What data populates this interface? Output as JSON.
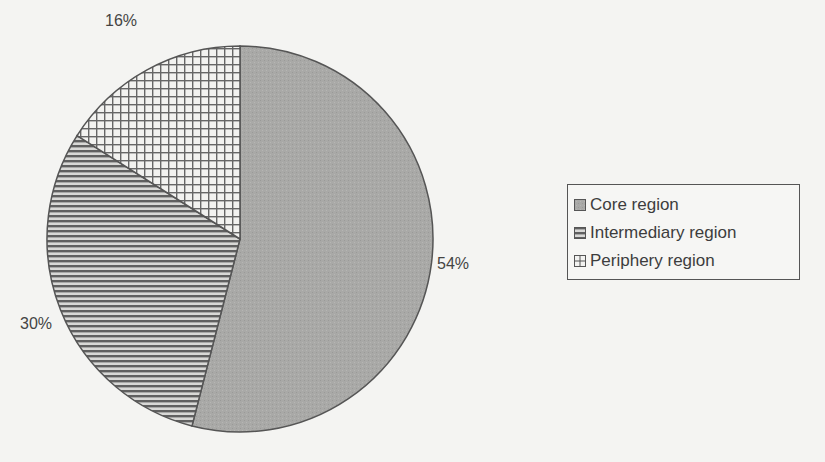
{
  "chart_data": {
    "type": "pie",
    "title": "",
    "categories": [
      "Core region",
      "Intermediary region",
      "Periphery region"
    ],
    "values": [
      54,
      30,
      16
    ],
    "labels": [
      "54%",
      "30%",
      "16%"
    ],
    "legend_position": "right",
    "patterns": [
      "stipple-gray",
      "horizontal-lines",
      "grid"
    ],
    "start_angle_deg": 0,
    "direction": "clockwise"
  },
  "legend": {
    "items": [
      {
        "label": "Core region",
        "pattern": "stipple"
      },
      {
        "label": "Intermediary region",
        "pattern": "hlines"
      },
      {
        "label": "Periphery region",
        "pattern": "grid"
      }
    ]
  },
  "slice_labels": {
    "core": "54%",
    "intermediary": "30%",
    "periphery": "16%"
  },
  "colors": {
    "core_fill": "#a9a9a7",
    "line": "#555555",
    "background": "#f4f4f2"
  }
}
